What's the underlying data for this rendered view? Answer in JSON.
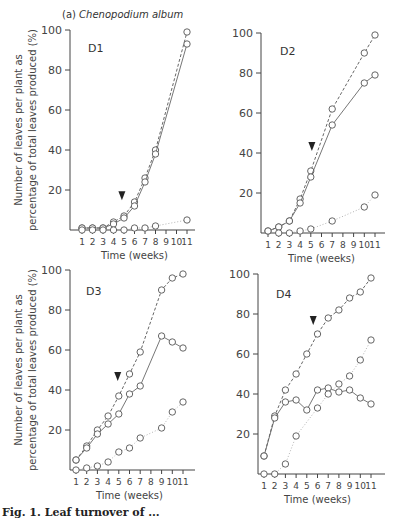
{
  "figure": {
    "title_prefix": "(a)",
    "title_species": "Chenopodium album",
    "caption": "Fig. 1.  Leaf turnover of ..."
  },
  "axes": {
    "ylabel_line1": "Number of leaves per plant as",
    "ylabel_line2": "percentage of total leaves produced (%)",
    "xlabel": "Time (weeks)",
    "yticks": [
      0,
      20,
      40,
      60,
      80,
      100
    ],
    "xticks": [
      1,
      2,
      3,
      4,
      5,
      6,
      7,
      8,
      9,
      10,
      11
    ]
  },
  "chart_data": [
    {
      "type": "line",
      "panel": "D1",
      "title": "D1",
      "xlabel": "Time (weeks)",
      "ylabel": "Number of leaves per plant as percentage of total leaves produced (%)",
      "ylim": [
        0,
        100
      ],
      "x": [
        1,
        2,
        3,
        4,
        5,
        6,
        7,
        8,
        9,
        10,
        11
      ],
      "arrow_at_week": 4.8,
      "series": [
        {
          "name": "cumulative produced (dashed)",
          "style": "dashed",
          "x": [
            1,
            2,
            3,
            4,
            5,
            6,
            7,
            8,
            11
          ],
          "values": [
            1,
            1,
            1,
            4,
            7,
            14,
            26,
            40,
            99
          ]
        },
        {
          "name": "living leaves (solid)",
          "style": "solid",
          "x": [
            1,
            2,
            3,
            4,
            5,
            6,
            7,
            8,
            11
          ],
          "values": [
            1,
            1,
            1,
            3,
            6,
            12,
            24,
            38,
            93
          ]
        },
        {
          "name": "senesced/dead (dotted)",
          "style": "dotted",
          "x": [
            1,
            2,
            3,
            4,
            5,
            6,
            7,
            8,
            11
          ],
          "values": [
            0,
            0,
            0,
            0,
            0,
            1,
            1,
            2,
            5
          ]
        }
      ]
    },
    {
      "type": "line",
      "panel": "D2",
      "title": "D2",
      "xlabel": "Time (weeks)",
      "ylim": [
        0,
        100
      ],
      "x": [
        1,
        2,
        3,
        4,
        5,
        6,
        7,
        8,
        9,
        10,
        11
      ],
      "arrow_at_week": 5.1,
      "series": [
        {
          "name": "cumulative produced (dashed)",
          "style": "dashed",
          "x": [
            1,
            2,
            3,
            4,
            5,
            7,
            10,
            11
          ],
          "values": [
            1,
            3,
            6,
            17,
            31,
            62,
            90,
            99
          ]
        },
        {
          "name": "living leaves (solid)",
          "style": "solid",
          "x": [
            1,
            2,
            3,
            4,
            5,
            7,
            10,
            11
          ],
          "values": [
            1,
            3,
            6,
            15,
            28,
            54,
            75,
            79
          ]
        },
        {
          "name": "senesced/dead (dotted)",
          "style": "dotted",
          "x": [
            2,
            3,
            4,
            5,
            7,
            10,
            11
          ],
          "values": [
            0,
            0,
            1,
            2,
            6,
            13,
            19
          ]
        }
      ]
    },
    {
      "type": "line",
      "panel": "D3",
      "title": "D3",
      "xlabel": "Time (weeks)",
      "ylim": [
        0,
        100
      ],
      "x": [
        1,
        2,
        3,
        4,
        5,
        6,
        7,
        8,
        9,
        10,
        11
      ],
      "arrow_at_week": 4.9,
      "series": [
        {
          "name": "cumulative produced (dashed)",
          "style": "dashed",
          "x": [
            1,
            2,
            3,
            4,
            5,
            6,
            7,
            9,
            10,
            11
          ],
          "values": [
            5,
            12,
            20,
            27,
            37,
            48,
            59,
            90,
            96,
            98
          ]
        },
        {
          "name": "living leaves (solid)",
          "style": "solid",
          "x": [
            1,
            2,
            3,
            4,
            5,
            6,
            7,
            9,
            10,
            11
          ],
          "values": [
            5,
            11,
            18,
            23,
            28,
            38,
            42,
            67,
            64,
            61
          ]
        },
        {
          "name": "senesced/dead (dotted)",
          "style": "dotted",
          "x": [
            1,
            2,
            3,
            4,
            5,
            6,
            7,
            9,
            10,
            11
          ],
          "values": [
            0,
            1,
            2,
            4,
            9,
            11,
            16,
            21,
            29,
            34
          ]
        }
      ]
    },
    {
      "type": "line",
      "panel": "D4",
      "title": "D4",
      "xlabel": "Time (weeks)",
      "ylim": [
        0,
        100
      ],
      "x": [
        1,
        2,
        3,
        4,
        5,
        6,
        7,
        8,
        9,
        10,
        11
      ],
      "arrow_at_week": 5.6,
      "series": [
        {
          "name": "cumulative produced (dashed)",
          "style": "dashed",
          "x": [
            1,
            2,
            3,
            4,
            5,
            6,
            7,
            8,
            9,
            10,
            11
          ],
          "values": [
            9,
            29,
            42,
            50,
            60,
            70,
            78,
            82,
            88,
            91,
            98
          ]
        },
        {
          "name": "living leaves (solid)",
          "style": "solid",
          "x": [
            1,
            2,
            3,
            4,
            5,
            6,
            7,
            8,
            9,
            10,
            11
          ],
          "values": [
            9,
            28,
            36,
            37,
            32,
            42,
            43,
            41,
            42,
            38,
            35
          ]
        },
        {
          "name": "senesced/dead (dotted)",
          "style": "dotted",
          "x": [
            1,
            2,
            3,
            4,
            6,
            7,
            8,
            9,
            10,
            11
          ],
          "values": [
            0,
            0,
            5,
            19,
            33,
            40,
            45,
            49,
            57,
            67
          ]
        }
      ]
    }
  ]
}
